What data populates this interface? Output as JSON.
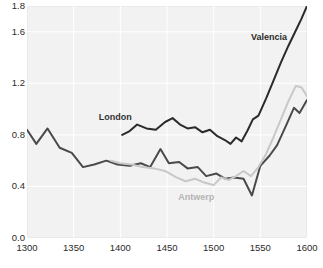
{
  "chart_data": {
    "type": "line",
    "title": "",
    "xlabel": "",
    "ylabel": "",
    "xlim": [
      1300,
      1600
    ],
    "ylim": [
      0.0,
      1.8
    ],
    "grid": true,
    "legend_position": "inline-annotations",
    "xticks": [
      1300,
      1350,
      1400,
      1450,
      1500,
      1550,
      1600
    ],
    "xtick_labels": [
      "1300",
      "1350",
      "1400",
      "1450",
      "1500",
      "1550",
      "1600"
    ],
    "yticks": [
      0.0,
      0.4,
      0.8,
      1.2,
      1.6,
      1.8
    ],
    "ytick_labels": [
      "0.0",
      "0.4",
      "0.8",
      "1.2",
      "1.6",
      "1.8"
    ],
    "series": [
      {
        "name": "London",
        "color": "#4a4a4a",
        "label_color": "#333333",
        "label_x": 1377,
        "label_y": 0.93,
        "points": [
          [
            1300,
            0.84
          ],
          [
            1310,
            0.73
          ],
          [
            1322,
            0.85
          ],
          [
            1335,
            0.7
          ],
          [
            1348,
            0.66
          ],
          [
            1360,
            0.55
          ],
          [
            1372,
            0.57
          ],
          [
            1385,
            0.6
          ],
          [
            1397,
            0.57
          ],
          [
            1410,
            0.56
          ],
          [
            1422,
            0.58
          ],
          [
            1432,
            0.55
          ],
          [
            1443,
            0.69
          ],
          [
            1452,
            0.58
          ],
          [
            1463,
            0.59
          ],
          [
            1472,
            0.54
          ],
          [
            1483,
            0.55
          ],
          [
            1492,
            0.48
          ],
          [
            1503,
            0.5
          ],
          [
            1512,
            0.46
          ],
          [
            1522,
            0.47
          ],
          [
            1532,
            0.46
          ],
          [
            1541,
            0.33
          ],
          [
            1550,
            0.56
          ],
          [
            1560,
            0.64
          ],
          [
            1568,
            0.72
          ],
          [
            1578,
            0.88
          ],
          [
            1586,
            1.01
          ],
          [
            1592,
            0.97
          ],
          [
            1600,
            1.07
          ]
        ]
      },
      {
        "name": "Antwerp",
        "color": "#c8c8c8",
        "label_color": "#b4b4b4",
        "label_x": 1462,
        "label_y": 0.31,
        "points": [
          [
            1390,
            0.6
          ],
          [
            1400,
            0.58
          ],
          [
            1412,
            0.57
          ],
          [
            1424,
            0.55
          ],
          [
            1436,
            0.54
          ],
          [
            1448,
            0.52
          ],
          [
            1460,
            0.47
          ],
          [
            1470,
            0.44
          ],
          [
            1480,
            0.46
          ],
          [
            1490,
            0.43
          ],
          [
            1500,
            0.41
          ],
          [
            1508,
            0.47
          ],
          [
            1516,
            0.45
          ],
          [
            1524,
            0.48
          ],
          [
            1532,
            0.52
          ],
          [
            1540,
            0.48
          ],
          [
            1548,
            0.55
          ],
          [
            1556,
            0.65
          ],
          [
            1564,
            0.78
          ],
          [
            1572,
            0.92
          ],
          [
            1580,
            1.06
          ],
          [
            1588,
            1.18
          ],
          [
            1594,
            1.17
          ],
          [
            1600,
            1.1
          ]
        ]
      },
      {
        "name": "Valencia",
        "color": "#2b2b2b",
        "label_color": "#2b2b2b",
        "label_x": 1540,
        "label_y": 1.55,
        "points": [
          [
            1402,
            0.8
          ],
          [
            1410,
            0.83
          ],
          [
            1418,
            0.88
          ],
          [
            1428,
            0.85
          ],
          [
            1438,
            0.84
          ],
          [
            1448,
            0.9
          ],
          [
            1456,
            0.93
          ],
          [
            1464,
            0.88
          ],
          [
            1472,
            0.85
          ],
          [
            1480,
            0.86
          ],
          [
            1488,
            0.82
          ],
          [
            1496,
            0.84
          ],
          [
            1504,
            0.79
          ],
          [
            1512,
            0.76
          ],
          [
            1518,
            0.73
          ],
          [
            1524,
            0.78
          ],
          [
            1530,
            0.75
          ],
          [
            1536,
            0.83
          ],
          [
            1542,
            0.92
          ],
          [
            1548,
            0.95
          ],
          [
            1556,
            1.08
          ],
          [
            1564,
            1.22
          ],
          [
            1572,
            1.36
          ],
          [
            1580,
            1.49
          ],
          [
            1588,
            1.61
          ],
          [
            1594,
            1.7
          ],
          [
            1600,
            1.8
          ]
        ]
      }
    ]
  },
  "colors": {
    "plot_background": "#f2f2f2",
    "page_background": "#ffffff",
    "grid_line": "#ffffff",
    "frame_border": "#d4d4d4",
    "tick_text": "#2b2b2b"
  }
}
